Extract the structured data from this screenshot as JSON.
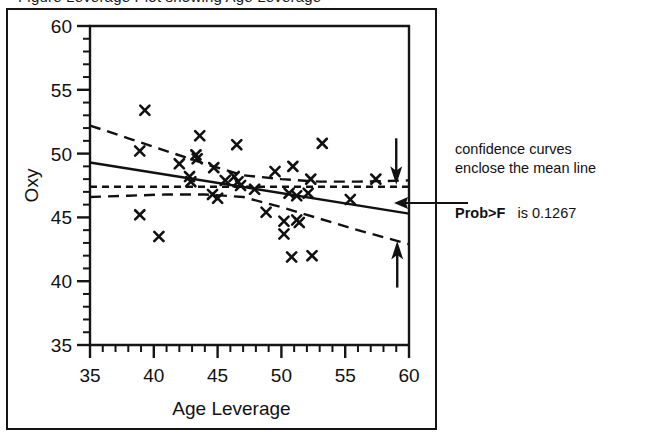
{
  "figure": {
    "clipped_caption": "Figure   Leverage Plot showing   Age Leverage",
    "plot_kind": "leverage-plot"
  },
  "annotations": {
    "line1": "confidence curves",
    "line2": "enclose the mean line",
    "prob_label": "Prob>F",
    "prob_value": "is 0.1267",
    "pointer_arrow": "left-arrow-icon",
    "upper_band_arrow": "down-arrow-icon",
    "lower_band_arrow": "up-arrow-icon"
  },
  "chart_data": {
    "type": "scatter",
    "title": "",
    "xlabel": "Age   Leverage",
    "ylabel": "Oxy",
    "xlim": [
      35,
      60
    ],
    "ylim": [
      35,
      60
    ],
    "xticks": [
      35,
      40,
      45,
      50,
      55,
      60
    ],
    "xtick_labels": [
      "35",
      "40",
      "45",
      "50",
      "55",
      "60"
    ],
    "yticks": [
      35,
      40,
      45,
      50,
      55,
      60
    ],
    "ytick_labels": [
      "35",
      "40",
      "45",
      "50",
      "55",
      "60"
    ],
    "minor_xticks": [
      36,
      37,
      38,
      39,
      41,
      42,
      43,
      44,
      46,
      47,
      48,
      49,
      51,
      52,
      53,
      54,
      56,
      57,
      58,
      59
    ],
    "minor_yticks": [
      36,
      37,
      38,
      39,
      41,
      42,
      43,
      44,
      46,
      47,
      48,
      49,
      51,
      52,
      53,
      54,
      56,
      57,
      58,
      59
    ],
    "grid": false,
    "legend": "none",
    "points": [
      {
        "x": 39.3,
        "y": 53.4
      },
      {
        "x": 38.9,
        "y": 50.2
      },
      {
        "x": 43.6,
        "y": 51.4
      },
      {
        "x": 46.5,
        "y": 50.7
      },
      {
        "x": 53.2,
        "y": 50.8
      },
      {
        "x": 42.0,
        "y": 49.2
      },
      {
        "x": 43.3,
        "y": 49.9
      },
      {
        "x": 43.4,
        "y": 49.6
      },
      {
        "x": 44.7,
        "y": 48.9
      },
      {
        "x": 49.5,
        "y": 48.6
      },
      {
        "x": 50.9,
        "y": 49.0
      },
      {
        "x": 42.8,
        "y": 48.2
      },
      {
        "x": 42.9,
        "y": 47.8
      },
      {
        "x": 45.6,
        "y": 47.9
      },
      {
        "x": 46.3,
        "y": 48.2
      },
      {
        "x": 46.6,
        "y": 47.8
      },
      {
        "x": 46.8,
        "y": 47.5
      },
      {
        "x": 52.3,
        "y": 48.0
      },
      {
        "x": 57.4,
        "y": 48.0
      },
      {
        "x": 44.6,
        "y": 46.8
      },
      {
        "x": 45.0,
        "y": 46.5
      },
      {
        "x": 47.9,
        "y": 47.2
      },
      {
        "x": 50.6,
        "y": 46.9
      },
      {
        "x": 51.2,
        "y": 46.7
      },
      {
        "x": 52.1,
        "y": 46.9
      },
      {
        "x": 55.4,
        "y": 46.4
      },
      {
        "x": 38.9,
        "y": 45.2
      },
      {
        "x": 48.8,
        "y": 45.4
      },
      {
        "x": 50.2,
        "y": 44.7
      },
      {
        "x": 51.2,
        "y": 44.8
      },
      {
        "x": 51.4,
        "y": 44.6
      },
      {
        "x": 40.4,
        "y": 43.5
      },
      {
        "x": 50.2,
        "y": 43.7
      },
      {
        "x": 50.8,
        "y": 41.9
      },
      {
        "x": 52.4,
        "y": 42.0
      }
    ],
    "series": [
      {
        "name": "fitted mean line",
        "style": "solid",
        "points": [
          {
            "x": 35,
            "y": 49.3
          },
          {
            "x": 60,
            "y": 45.3
          }
        ]
      },
      {
        "name": "horizontal mean line",
        "style": "dashed-fine",
        "points": [
          {
            "x": 35,
            "y": 47.4
          },
          {
            "x": 60,
            "y": 47.4
          }
        ]
      },
      {
        "name": "upper confidence curve",
        "style": "dashed",
        "points": [
          {
            "x": 35,
            "y": 52.2
          },
          {
            "x": 38,
            "y": 51.2
          },
          {
            "x": 41,
            "y": 50.2
          },
          {
            "x": 44,
            "y": 49.2
          },
          {
            "x": 47,
            "y": 48.3
          },
          {
            "x": 50,
            "y": 48.0
          },
          {
            "x": 53,
            "y": 47.8
          },
          {
            "x": 56,
            "y": 47.8
          },
          {
            "x": 60,
            "y": 47.9
          }
        ]
      },
      {
        "name": "lower confidence curve",
        "style": "dashed",
        "points": [
          {
            "x": 35,
            "y": 46.6
          },
          {
            "x": 38,
            "y": 46.7
          },
          {
            "x": 41,
            "y": 46.8
          },
          {
            "x": 44,
            "y": 46.8
          },
          {
            "x": 47,
            "y": 46.6
          },
          {
            "x": 50,
            "y": 45.8
          },
          {
            "x": 53,
            "y": 44.9
          },
          {
            "x": 56,
            "y": 44.0
          },
          {
            "x": 60,
            "y": 42.9
          }
        ]
      }
    ],
    "marker": "x"
  }
}
